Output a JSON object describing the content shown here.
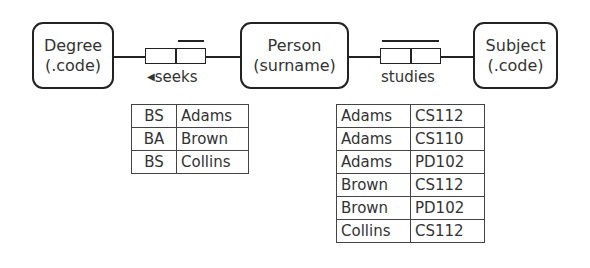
{
  "entities": [
    {
      "name": "Degree",
      "ref": "(.code)"
    },
    {
      "name": "Person",
      "ref": "(surname)"
    },
    {
      "name": "Subject",
      "ref": "(.code)"
    }
  ],
  "facts": [
    {
      "reading": "seeks",
      "direction_marker": "◀",
      "uniqueness": "right-role"
    },
    {
      "reading": "studies",
      "direction_marker": "",
      "uniqueness": "spanning"
    }
  ],
  "seeks_population": {
    "rows": [
      [
        "BS",
        "Adams"
      ],
      [
        "BA",
        "Brown"
      ],
      [
        "BS",
        "Collins"
      ]
    ]
  },
  "studies_population": {
    "rows": [
      [
        "Adams",
        "CS112"
      ],
      [
        "Adams",
        "CS110"
      ],
      [
        "Adams",
        "PD102"
      ],
      [
        "Brown",
        "CS112"
      ],
      [
        "Brown",
        "PD102"
      ],
      [
        "Collins",
        "CS112"
      ]
    ]
  }
}
